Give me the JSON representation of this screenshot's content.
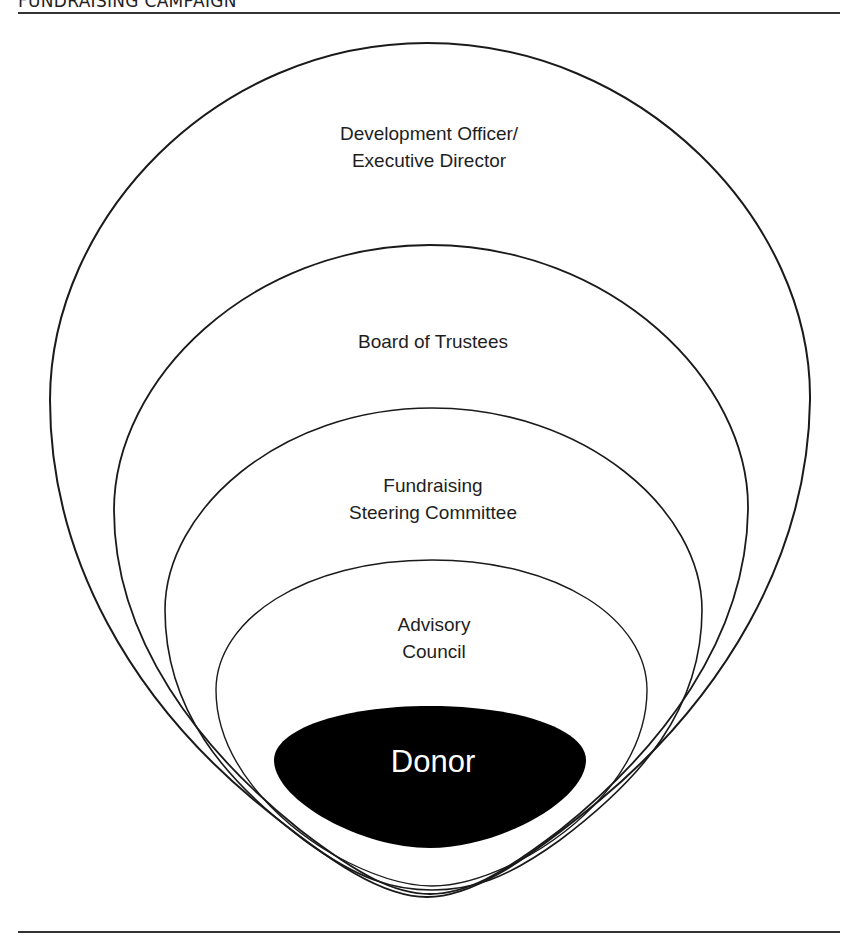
{
  "header": {
    "title": "FUNDRAISING CAMPAIGN"
  },
  "diagram": {
    "layers": [
      {
        "id": "development-officer",
        "line1": "Development Officer/",
        "line2": "Executive Director"
      },
      {
        "id": "board-of-trustees",
        "line1": "Board of Trustees"
      },
      {
        "id": "steering-committee",
        "line1": "Fundraising",
        "line2": "Steering Committee"
      },
      {
        "id": "advisory-council",
        "line1": "Advisory",
        "line2": "Council"
      }
    ],
    "core": {
      "label": "Donor",
      "fill": "#000000",
      "text_color": "#ffffff"
    }
  }
}
